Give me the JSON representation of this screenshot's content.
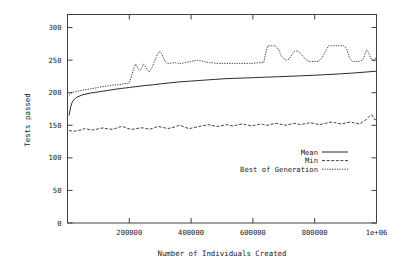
{
  "chart_data": {
    "type": "line",
    "title": "",
    "xlabel": "Number of Individuals Created",
    "ylabel": "Tests passed",
    "xlim": [
      0,
      1000000
    ],
    "ylim": [
      0,
      320
    ],
    "grid": false,
    "legend_position": "inside-lower-right",
    "xticks": [
      200000,
      400000,
      600000,
      800000,
      1000000
    ],
    "xtick_labels": [
      "200000",
      "400000",
      "600000",
      "800000",
      "1e+06"
    ],
    "yticks": [
      0,
      50,
      100,
      150,
      200,
      250,
      300
    ],
    "ytick_labels": [
      "0",
      "50",
      "100",
      "150",
      "200",
      "250",
      "300"
    ],
    "series": [
      {
        "name": "Mean",
        "style": "solid",
        "x": [
          5000,
          10000,
          15000,
          20000,
          25000,
          30000,
          40000,
          50000,
          60000,
          75000,
          90000,
          110000,
          130000,
          150000,
          175000,
          200000,
          225000,
          250000,
          275000,
          300000,
          330000,
          360000,
          390000,
          420000,
          450000,
          480000,
          510000,
          540000,
          570000,
          600000,
          640000,
          680000,
          720000,
          760000,
          800000,
          840000,
          880000,
          920000,
          960000,
          1000000
        ],
        "values": [
          165,
          178,
          185,
          189,
          191,
          193,
          195,
          197,
          198,
          199.5,
          200.5,
          202,
          203.5,
          205,
          206.5,
          208,
          209.5,
          211,
          212,
          213.5,
          215,
          216.5,
          217.5,
          218.5,
          219.5,
          220.5,
          221.5,
          222,
          222.5,
          223,
          223.8,
          224.5,
          225.2,
          226,
          226.8,
          227.8,
          228.8,
          230,
          231.5,
          233
        ]
      },
      {
        "name": "Min",
        "style": "dashed",
        "x": [
          5000,
          15000,
          25000,
          35000,
          45000,
          55000,
          65000,
          75000,
          85000,
          95000,
          105000,
          115000,
          125000,
          135000,
          145000,
          155000,
          165000,
          175000,
          185000,
          195000,
          205000,
          215000,
          225000,
          235000,
          245000,
          255000,
          265000,
          275000,
          285000,
          295000,
          305000,
          315000,
          325000,
          335000,
          345000,
          355000,
          365000,
          375000,
          385000,
          395000,
          405000,
          415000,
          425000,
          435000,
          445000,
          455000,
          465000,
          475000,
          485000,
          495000,
          505000,
          515000,
          525000,
          535000,
          545000,
          555000,
          565000,
          575000,
          585000,
          595000,
          605000,
          615000,
          625000,
          635000,
          645000,
          655000,
          665000,
          675000,
          685000,
          695000,
          705000,
          715000,
          725000,
          735000,
          745000,
          755000,
          765000,
          775000,
          785000,
          795000,
          805000,
          815000,
          825000,
          835000,
          845000,
          855000,
          865000,
          875000,
          885000,
          895000,
          905000,
          915000,
          925000,
          935000,
          945000,
          955000,
          965000,
          975000,
          985000,
          995000,
          1000000
        ],
        "values": [
          142,
          141,
          141,
          142,
          143,
          145,
          144,
          143,
          143,
          144,
          145,
          146,
          145,
          144,
          144,
          145,
          147,
          148,
          147,
          145,
          144,
          144,
          145,
          146,
          146,
          145,
          144,
          145,
          147,
          148,
          147,
          146,
          145,
          146,
          147,
          149,
          150,
          148,
          146,
          145,
          146,
          147,
          148,
          149,
          150,
          151,
          150,
          149,
          148,
          149,
          150,
          151,
          150,
          149,
          150,
          151,
          152,
          151,
          150,
          149,
          150,
          151,
          152,
          151,
          150,
          151,
          152,
          153,
          152,
          151,
          150,
          151,
          152,
          153,
          152,
          151,
          152,
          153,
          154,
          153,
          152,
          151,
          152,
          153,
          154,
          155,
          154,
          153,
          152,
          153,
          154,
          155,
          154,
          153,
          152,
          155,
          158,
          163,
          166,
          158,
          160
        ]
      },
      {
        "name": "Best of Generation",
        "style": "dotted",
        "x": [
          5000,
          12000,
          20000,
          30000,
          40000,
          50000,
          62000,
          75000,
          88000,
          100000,
          112000,
          125000,
          138000,
          150000,
          162000,
          175000,
          185000,
          195000,
          200000,
          205000,
          210000,
          215000,
          220000,
          225000,
          230000,
          235000,
          240000,
          245000,
          250000,
          255000,
          260000,
          265000,
          270000,
          275000,
          280000,
          285000,
          290000,
          295000,
          300000,
          305000,
          310000,
          315000,
          320000,
          325000,
          330000,
          340000,
          350000,
          360000,
          370000,
          380000,
          390000,
          400000,
          410000,
          420000,
          430000,
          440000,
          450000,
          460000,
          470000,
          480000,
          490000,
          500000,
          520000,
          540000,
          560000,
          580000,
          600000,
          615000,
          625000,
          635000,
          640000,
          648000,
          660000,
          672000,
          684000,
          690000,
          700000,
          710000,
          718000,
          726000,
          735000,
          745000,
          755000,
          765000,
          775000,
          782000,
          790000,
          800000,
          812000,
          824000,
          836000,
          845000,
          855000,
          865000,
          875000,
          885000,
          895000,
          903000,
          912000,
          922000,
          935000,
          945000,
          955000,
          962000,
          968000,
          974000,
          980000,
          986000,
          992000,
          1000000
        ],
        "values": [
          196,
          199,
          201,
          202,
          203,
          204,
          205,
          206,
          207,
          208,
          209,
          210,
          211,
          212,
          212,
          213,
          214,
          214,
          215,
          222,
          230,
          238,
          244,
          240,
          236,
          234,
          238,
          244,
          242,
          238,
          234,
          232,
          236,
          240,
          246,
          252,
          258,
          262,
          263,
          260,
          254,
          248,
          246,
          245,
          245,
          246,
          246,
          245,
          245,
          246,
          247,
          248,
          249,
          250,
          249,
          248,
          247,
          246,
          246,
          245,
          245,
          245,
          245,
          245,
          245,
          245,
          245,
          246,
          246,
          246,
          258,
          272,
          272,
          272,
          266,
          258,
          252,
          250,
          252,
          258,
          264,
          264,
          260,
          254,
          250,
          248,
          248,
          248,
          248,
          254,
          264,
          272,
          272,
          272,
          272,
          272,
          272,
          268,
          254,
          248,
          248,
          248,
          250,
          258,
          266,
          262,
          254,
          250,
          248,
          255
        ]
      }
    ]
  },
  "legend": {
    "items": [
      {
        "label": "Mean",
        "style": "solid"
      },
      {
        "label": "Min",
        "style": "dashed"
      },
      {
        "label": "Best of Generation",
        "style": "dotted"
      }
    ]
  }
}
